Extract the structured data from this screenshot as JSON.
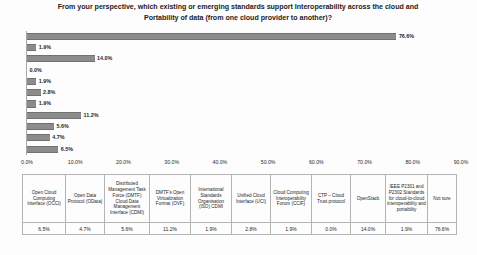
{
  "chart_title": {
    "line1": "From your perspective, which existing or emerging standards support Interoperability across the cloud and",
    "line2": "Portability of data (from one cloud provider to another)?"
  },
  "chart_data": {
    "type": "bar",
    "orientation": "horizontal",
    "title": "From your perspective, which existing or emerging standards support Interoperability across the cloud and Portability of data (from one cloud provider to another)?",
    "xlabel": "",
    "ylabel": "",
    "xlim": [
      0,
      90
    ],
    "grid": false,
    "legend": "none",
    "axis_tick_suffix": "%",
    "categories": [
      "Open Cloud Computing Interface (OCCI)",
      "Open Data Protocol (OData)",
      "Distributed Management Task Force (DMTF) Cloud Data Management Interface (CDMI)",
      "DMTF's Open Virtualization Format (OVF)",
      "International Standards Organisation (ISO) CDMI",
      "Unified Cloud Interface (UCI)",
      "Cloud Computing Interoperability Forum (CCIF)",
      "CTP – Cloud Trust protocol",
      "OpenStack",
      "IEEE P2301 and P2302 Standards for cloud-to-cloud interoperability and portability",
      "Not sure"
    ],
    "values": [
      6.5,
      4.7,
      5.6,
      11.2,
      1.9,
      2.8,
      1.9,
      0.0,
      14.0,
      1.9,
      76.6
    ],
    "value_labels": [
      "6.5%",
      "4.7%",
      "5.6%",
      "11.2%",
      "1.9%",
      "2.8%",
      "1.9%",
      "0.0%",
      "14.0%",
      "1.9%",
      "76.6%"
    ],
    "xticks": [
      0,
      10,
      20,
      30,
      40,
      50,
      60,
      70,
      80,
      90
    ],
    "xtick_labels": [
      "0.0%",
      "10.0%",
      "20.0%",
      "30.0%",
      "40.0%",
      "50.0%",
      "60.0%",
      "70.0%",
      "80.0%",
      "90.0%"
    ],
    "bar_color": "#8c8c8c",
    "plot_order": "reversed"
  },
  "table": {
    "headers": [
      "Open Cloud Computing Interface (OCCI)",
      "Open Data Protocol (OData)",
      "Distributed Management Task Force (DMTF) Cloud Data Management Interface (CDMI)",
      "DMTF's Open Virtualization Format (OVF)",
      "International Standards Organisation (ISO) CDMI",
      "Unified Cloud Interface (UCI)",
      "Cloud Computing Interoperability Forum (CCIF)",
      "CTP – Cloud Trust protocol",
      "OpenStack",
      "IEEE P2301 and P2302 Standards for cloud-to-cloud interoperability and portability",
      "Not sure"
    ],
    "values": [
      "6.5%",
      "4.7%",
      "5.6%",
      "11.2%",
      "1.9%",
      "2.8%",
      "1.9%",
      "0.0%",
      "14.0%",
      "1.9%",
      "76.6%"
    ]
  }
}
